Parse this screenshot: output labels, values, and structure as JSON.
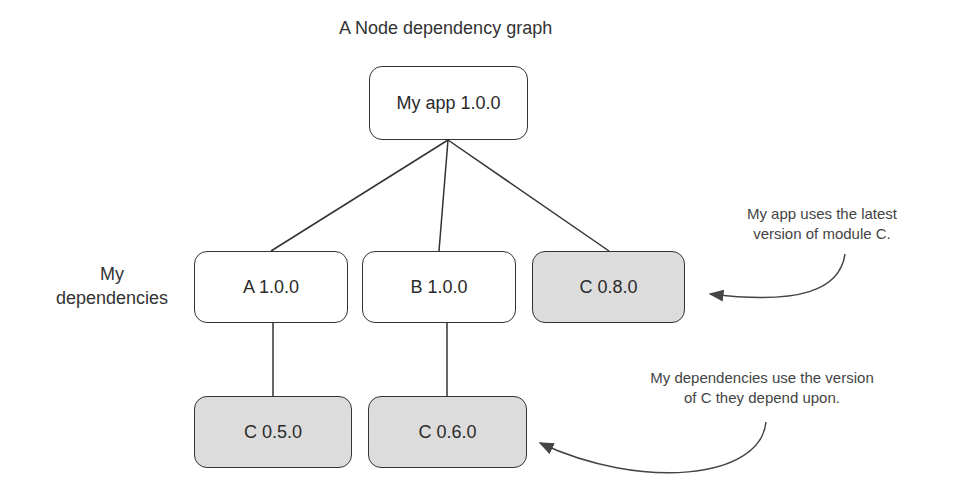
{
  "title": "A Node dependency graph",
  "side_label": {
    "line1": "My",
    "line2": "dependencies"
  },
  "nodes": {
    "root": {
      "label": "My app 1.0.0",
      "shaded": false
    },
    "a": {
      "label": "A 1.0.0",
      "shaded": false
    },
    "b": {
      "label": "B 1.0.0",
      "shaded": false
    },
    "c_top": {
      "label": "C 0.8.0",
      "shaded": true
    },
    "c_a": {
      "label": "C 0.5.0",
      "shaded": true
    },
    "c_b": {
      "label": "C 0.6.0",
      "shaded": true
    }
  },
  "annotations": {
    "app": {
      "line1": "My app uses the latest",
      "line2": "version of module C."
    },
    "deps": {
      "line1": "My dependencies use the version",
      "line2": "of C they depend upon."
    }
  },
  "colors": {
    "shaded_fill": "#dcdcdc",
    "stroke": "#333333"
  }
}
